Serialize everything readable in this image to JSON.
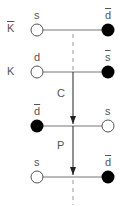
{
  "diagram": {
    "rows": [
      {
        "meson": "K",
        "meson_bar": true,
        "left_quark": "s",
        "left_bar": false,
        "left_fill": "open",
        "right_quark": "d",
        "right_bar": true,
        "right_fill": "filled"
      },
      {
        "meson": "K",
        "meson_bar": false,
        "left_quark": "d",
        "left_bar": false,
        "left_fill": "open",
        "right_quark": "s",
        "right_bar": true,
        "right_fill": "filled"
      },
      {
        "meson": "",
        "meson_bar": false,
        "left_quark": "d",
        "left_bar": true,
        "left_fill": "filled",
        "right_quark": "s",
        "right_bar": false,
        "right_fill": "open"
      },
      {
        "meson": "",
        "meson_bar": false,
        "left_quark": "s",
        "left_bar": false,
        "left_fill": "open",
        "right_quark": "d",
        "right_bar": true,
        "right_fill": "filled"
      }
    ],
    "operations": [
      {
        "label": "C",
        "from_row": 2,
        "to_row": 3
      },
      {
        "label": "P",
        "from_row": 3,
        "to_row": 4
      }
    ],
    "colors": {
      "line": "#777777",
      "filled": "#000000",
      "open_stroke": "#555555",
      "text": "#555555"
    }
  }
}
